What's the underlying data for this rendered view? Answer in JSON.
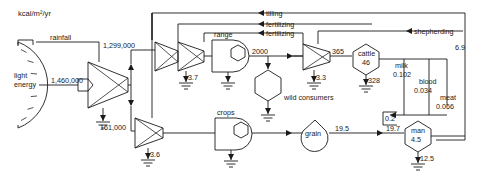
{
  "diagram": {
    "title_unit": "kcal/m²/yr",
    "type": "energy-systems-language",
    "sources": [
      {
        "id": "light-energy",
        "label_line1": "light",
        "label_line2": "energy",
        "symbol": "sun-arc"
      },
      {
        "id": "rainfall",
        "label": "rainfall",
        "symbol": "source-box"
      }
    ],
    "control_inputs": [
      {
        "id": "tilling",
        "label": "tilling"
      },
      {
        "id": "fertilizing-1",
        "label": "fertilizing"
      },
      {
        "id": "fertilizing-2",
        "label": "fertilizing"
      },
      {
        "id": "shepherding",
        "label": "shepherding"
      }
    ],
    "storages": [
      {
        "id": "range",
        "label": "range",
        "symbol": "producer"
      },
      {
        "id": "crops",
        "label": "crops",
        "symbol": "producer"
      },
      {
        "id": "wild-consumers",
        "label": "wild consumers",
        "symbol": "consumer-hexagon"
      },
      {
        "id": "cattle",
        "label": "cattle",
        "value": "46",
        "symbol": "consumer-hexagon"
      },
      {
        "id": "grain",
        "label": "grain",
        "symbol": "tank"
      },
      {
        "id": "man",
        "label": "man",
        "value": "4.5",
        "symbol": "consumer-hexagon"
      }
    ],
    "flows": [
      {
        "id": "solar-input",
        "value": "1,460,000"
      },
      {
        "id": "solar-to-range",
        "value": "1,299,000"
      },
      {
        "id": "solar-to-crops",
        "value": "161,000"
      },
      {
        "id": "range-to-cattle-branch",
        "value": "2000"
      },
      {
        "id": "cattle-intake",
        "value": "365"
      },
      {
        "id": "grain-yield",
        "value": "19.5"
      },
      {
        "id": "man-intake",
        "value": "19.7"
      },
      {
        "id": "animal-products-to-man",
        "value": "0.2"
      },
      {
        "id": "man-labor-return",
        "value": "6.9"
      }
    ],
    "heat_sinks": [
      {
        "id": "heat-solar-converter",
        "value": ""
      },
      {
        "id": "heat-range-interaction",
        "value": "3.7"
      },
      {
        "id": "heat-range",
        "value": ""
      },
      {
        "id": "heat-wild-consumers",
        "value": ""
      },
      {
        "id": "heat-cattle-interaction",
        "value": "3.3"
      },
      {
        "id": "heat-cattle",
        "value": "328"
      },
      {
        "id": "heat-crops-interaction",
        "value": "3.6"
      },
      {
        "id": "heat-crops",
        "value": ""
      },
      {
        "id": "heat-man",
        "value": "12.5"
      }
    ],
    "products": [
      {
        "id": "milk",
        "label": "milk",
        "value": "0.102"
      },
      {
        "id": "blood",
        "label": "blood",
        "value": "0.034"
      },
      {
        "id": "meat",
        "label": "meat",
        "value": "0.066"
      }
    ]
  }
}
